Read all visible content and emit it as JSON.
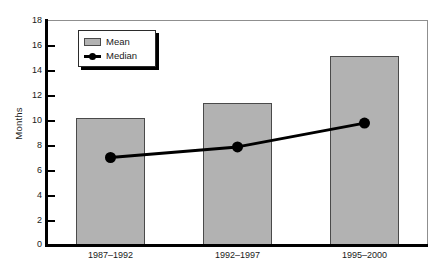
{
  "chart_data": {
    "type": "bar",
    "title": "",
    "subtitle": "",
    "xlabel": "",
    "ylabel": "Months",
    "categories": [
      "1987–1992",
      "1992–1997",
      "1995–2000"
    ],
    "series": [
      {
        "name": "Mean",
        "type": "bar",
        "values": [
          10.2,
          11.4,
          15.1
        ]
      },
      {
        "name": "Median",
        "type": "line",
        "values": [
          7.0,
          7.85,
          9.75
        ]
      }
    ],
    "ylim": [
      0,
      18
    ],
    "ytick_step": 2,
    "yticks": [
      0,
      2,
      4,
      6,
      8,
      10,
      12,
      14,
      16,
      18
    ],
    "ytick_labels": [
      "0",
      "2",
      "4",
      "6",
      "8",
      "10",
      "12",
      "14",
      "16",
      "18"
    ],
    "grid": false,
    "legend_position": "top-left-inside",
    "colors": {
      "bar_fill": "#b2b2b2",
      "bar_outline": "#4a4a4a",
      "line": "#000000",
      "marker": "#000000",
      "axis": "#000000",
      "frame": "#8f8f8f",
      "background": "#ffffff",
      "text": "#1a1a1a"
    }
  },
  "legend": {
    "items": [
      {
        "label": "Mean",
        "marker": "filled-square-swatch"
      },
      {
        "label": "Median",
        "marker": "line-with-circle-marker"
      }
    ]
  }
}
